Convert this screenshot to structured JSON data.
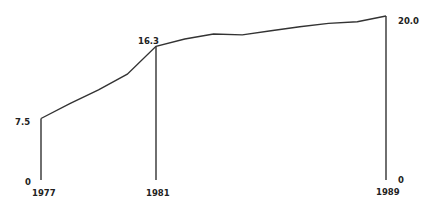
{
  "chart_data": {
    "type": "line",
    "title": "",
    "xlabel": "",
    "ylabel": "",
    "x": [
      1977,
      1978,
      1979,
      1980,
      1981,
      1982,
      1983,
      1984,
      1985,
      1986,
      1987,
      1988,
      1989
    ],
    "series": [
      {
        "name": "value",
        "values": [
          7.5,
          9.3,
          11.0,
          12.9,
          16.3,
          17.2,
          17.8,
          17.7,
          18.2,
          18.7,
          19.1,
          19.3,
          20.0
        ]
      }
    ],
    "ylim": [
      0,
      20
    ],
    "grid": false,
    "legend": null,
    "annotations": [
      {
        "x": 1977,
        "label": "7.5",
        "position": "left"
      },
      {
        "x": 1981,
        "label": "16.3",
        "position": "top"
      },
      {
        "x": 1989,
        "label": "20.0",
        "position": "right"
      }
    ],
    "x_tick_labels": [
      "1977",
      "1981",
      "1989"
    ],
    "baseline_labels": {
      "left": "0",
      "right": "0"
    },
    "line_color": "#333333"
  }
}
